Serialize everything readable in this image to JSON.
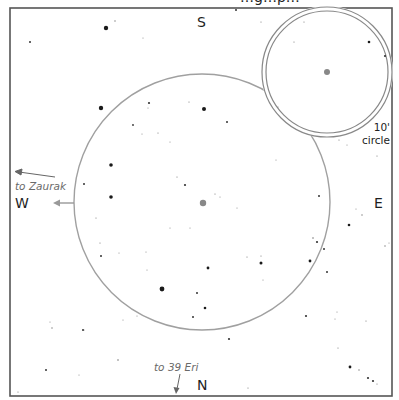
{
  "chart_title_clipped": "…g…p…",
  "frame": {
    "x": 10,
    "y": 8,
    "width": 382,
    "height": 388,
    "stroke": "#555555"
  },
  "directions": {
    "south": "S",
    "north": "N",
    "west": "W",
    "east": "E"
  },
  "pointers": {
    "zaurak": {
      "label": "to Zaurak",
      "from": [
        55,
        177
      ],
      "to": [
        16,
        172
      ]
    },
    "eri39": {
      "label": "to 39 Eri",
      "from": [
        180,
        374
      ],
      "to": [
        176,
        393
      ]
    },
    "west_arrow": {
      "from": [
        74,
        203
      ],
      "to": [
        54,
        203
      ]
    }
  },
  "main_circle": {
    "cx": 202,
    "cy": 202,
    "r": 128,
    "stroke": "#a0a0a0"
  },
  "finder_circle": {
    "cx": 327,
    "cy": 72,
    "r_outer": 65,
    "r_inner": 61,
    "stroke": "#888888",
    "label_line1": "10'",
    "label_line2": "circle"
  },
  "target": {
    "cx": 203,
    "cy": 203,
    "r": 3.2,
    "color": "#888888"
  },
  "finder_target": {
    "cx": 327,
    "cy": 72,
    "r": 3,
    "color": "#888888"
  },
  "stars": [
    [
      106,
      28,
      2.2
    ],
    [
      115,
      21,
      0.7
    ],
    [
      30,
      42,
      1
    ],
    [
      236,
      10,
      1
    ],
    [
      261,
      22,
      0.6
    ],
    [
      143,
      38,
      0.5
    ],
    [
      101,
      108,
      2.2
    ],
    [
      133,
      125,
      0.9
    ],
    [
      149,
      103,
      1.1
    ],
    [
      148,
      108,
      0.5
    ],
    [
      189,
      102,
      0.6
    ],
    [
      204,
      109,
      2
    ],
    [
      227,
      122,
      1
    ],
    [
      158,
      133,
      0.6
    ],
    [
      142,
      134,
      0.5
    ],
    [
      170,
      142,
      0.5
    ],
    [
      111,
      165,
      1.8
    ],
    [
      84,
      184,
      1
    ],
    [
      111,
      197,
      1.8
    ],
    [
      177,
      177,
      0.6
    ],
    [
      185,
      185,
      1.1
    ],
    [
      215,
      194,
      0.6
    ],
    [
      220,
      197,
      0.5
    ],
    [
      237,
      208,
      0.5
    ],
    [
      96,
      218,
      0.6
    ],
    [
      100,
      243,
      0.6
    ],
    [
      101,
      256,
      1
    ],
    [
      119,
      253,
      0.5
    ],
    [
      170,
      228,
      0.5
    ],
    [
      190,
      228,
      0.5
    ],
    [
      146,
      252,
      0.5
    ],
    [
      147,
      270,
      0.5
    ],
    [
      208,
      268,
      1.4
    ],
    [
      247,
      257,
      0.6
    ],
    [
      261,
      256,
      0.6
    ],
    [
      261,
      263,
      1.5
    ],
    [
      319,
      196,
      1
    ],
    [
      313,
      238,
      0.8
    ],
    [
      317,
      242,
      1.1
    ],
    [
      324,
      249,
      1
    ],
    [
      310,
      261,
      1.4
    ],
    [
      327,
      272,
      1
    ],
    [
      263,
      280,
      0.5
    ],
    [
      197,
      293,
      1
    ],
    [
      162,
      289,
      2.4
    ],
    [
      205,
      308,
      1.3
    ],
    [
      193,
      317,
      1
    ],
    [
      123,
      320,
      0.5
    ],
    [
      84,
      330,
      0.5
    ],
    [
      137,
      316,
      0.5
    ],
    [
      50,
      322,
      0.5
    ],
    [
      52,
      328,
      0.7
    ],
    [
      83,
      330,
      1
    ],
    [
      229,
      339,
      1.1
    ],
    [
      306,
      316,
      1.1
    ],
    [
      337,
      312,
      0.5
    ],
    [
      335,
      319,
      0.5
    ],
    [
      349,
      225,
      1.3
    ],
    [
      356,
      209,
      0.5
    ],
    [
      362,
      215,
      0.7
    ],
    [
      385,
      246,
      0.7
    ],
    [
      389,
      243,
      0.5
    ],
    [
      366,
      321,
      0.6
    ],
    [
      338,
      348,
      0.6
    ],
    [
      350,
      367,
      1.4
    ],
    [
      359,
      370,
      0.7
    ],
    [
      368,
      378,
      1.1
    ],
    [
      373,
      381,
      1.1
    ],
    [
      377,
      384,
      0.6
    ],
    [
      46,
      370,
      1
    ],
    [
      118,
      360,
      0.8
    ],
    [
      79,
      375,
      0.5
    ],
    [
      18,
      392,
      0.6
    ],
    [
      248,
      388,
      0.6
    ],
    [
      377,
      156,
      0.6
    ],
    [
      369,
      42,
      1.3
    ],
    [
      385,
      56,
      1.1
    ],
    [
      304,
      22,
      0.6
    ],
    [
      294,
      42,
      0.6
    ],
    [
      278,
      107,
      0.4
    ],
    [
      339,
      140,
      0.6
    ],
    [
      347,
      145,
      0.5
    ],
    [
      276,
      160,
      0.5
    ]
  ],
  "colors": {
    "ink": "#1e1e1e",
    "soft_gray": "#8a8a8a",
    "background": "#ffffff"
  }
}
